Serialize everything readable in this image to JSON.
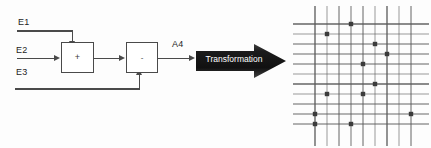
{
  "diagram": {
    "inputs": [
      {
        "label": "E1"
      },
      {
        "label": "E2"
      },
      {
        "label": "E3"
      }
    ],
    "blocks": [
      {
        "name": "sum-block",
        "symbol": "+"
      },
      {
        "name": "difference-block",
        "symbol": "-"
      }
    ],
    "output": {
      "label": "A4"
    },
    "transformation": {
      "label": "Transformation"
    },
    "colors": {
      "wire": "#4a4a4a",
      "text": "#1d1d1d",
      "arrow_fill_dark": "#1c1c1c",
      "arrow_fill_light": "#4d4d4d",
      "arrow_text": "#ffffff",
      "grid_line": "#595959",
      "grid_dot": "#3b3b3b"
    }
  },
  "chart_data": {
    "type": "scatter",
    "title": "",
    "xlabel": "",
    "ylabel": "",
    "grid": true,
    "legend": "none",
    "xlim": [
      0,
      136
    ],
    "ylim": [
      0,
      140
    ],
    "vertical_gridlines": [
      22,
      34,
      46,
      58,
      70,
      82,
      94,
      106,
      118
    ],
    "horizontal_gridlines": [
      18,
      28,
      38,
      48,
      58,
      68,
      78,
      88,
      98,
      108,
      118
    ],
    "points": [
      {
        "x": 58,
        "y": 18
      },
      {
        "x": 34,
        "y": 28
      },
      {
        "x": 82,
        "y": 38
      },
      {
        "x": 94,
        "y": 48
      },
      {
        "x": 70,
        "y": 58
      },
      {
        "x": 82,
        "y": 78
      },
      {
        "x": 34,
        "y": 88
      },
      {
        "x": 70,
        "y": 88
      },
      {
        "x": 22,
        "y": 108
      },
      {
        "x": 118,
        "y": 108
      },
      {
        "x": 22,
        "y": 118
      },
      {
        "x": 58,
        "y": 118
      }
    ]
  }
}
